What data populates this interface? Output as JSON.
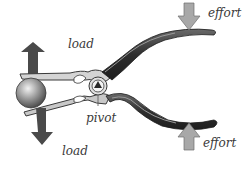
{
  "diagram": {
    "labels": {
      "load_top": "load",
      "load_bottom": "load",
      "pivot": "pivot",
      "effort_top": "effort",
      "effort_bottom": "effort"
    },
    "colors": {
      "load_arrow": "#4a4a4a",
      "effort_arrow": "#a8a8a8",
      "handle": "#3c3c3c",
      "jaw_metal": "#cfcfcf",
      "ball": "#9a9a9a",
      "label_text": "#3a3a3a"
    }
  }
}
